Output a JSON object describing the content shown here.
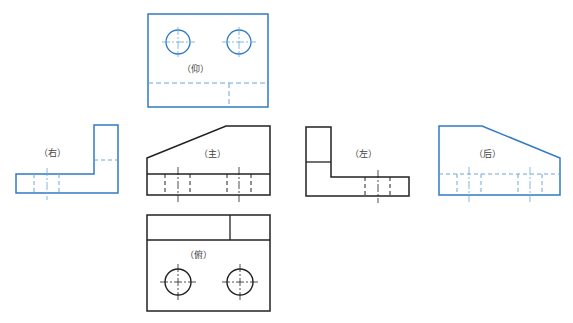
{
  "colors": {
    "black": "#222222",
    "blue": "#2f7bc4",
    "blue_light": "#6aa6dc"
  },
  "views": {
    "bottom": {
      "label": "（仰）",
      "color": "blue"
    },
    "right": {
      "label": "（右）",
      "color": "blue"
    },
    "front": {
      "label": "（主）",
      "color": "black"
    },
    "left": {
      "label": "（左）",
      "color": "black"
    },
    "rear": {
      "label": "（后）",
      "color": "blue"
    },
    "top": {
      "label": "（俯）",
      "color": "black"
    }
  }
}
